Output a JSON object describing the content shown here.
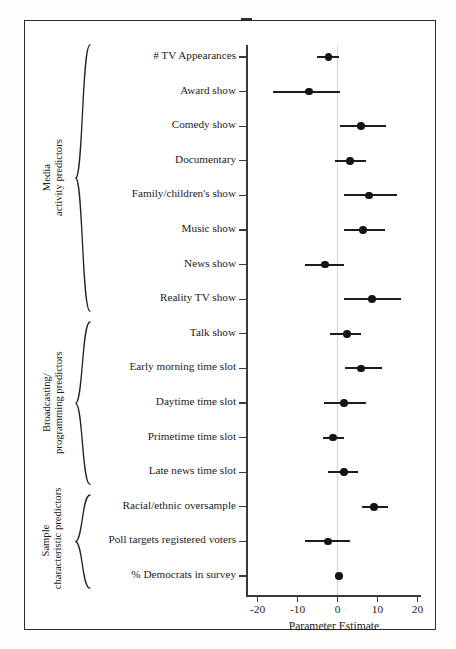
{
  "chart_data": {
    "type": "scatter",
    "title": "",
    "xlabel": "Parameter Estimate",
    "ylabel": "",
    "xlim": [
      -24,
      20
    ],
    "xticks": [
      -20,
      -10,
      0,
      10,
      20
    ],
    "xticklabels": [
      "-20",
      "-10",
      "0",
      "10",
      "20"
    ],
    "grid": false,
    "legend": "none",
    "zero_reference_line": 0,
    "categories": [
      "# TV Appearances",
      "Award show",
      "Comedy show",
      "Documentary",
      "Family/children's show",
      "Music show",
      "News show",
      "Reality TV show",
      "Talk show",
      "Early morning time slot",
      "Daytime time slot",
      "Primetime time slot",
      "Late news time slot",
      "Racial/ethnic oversample",
      "Poll targets registered voters",
      "% Democrats in survey"
    ],
    "values": [
      -2.3,
      -7.1,
      5.9,
      3.1,
      7.9,
      6.4,
      -3.1,
      8.6,
      2.4,
      5.9,
      1.6,
      -1.1,
      1.6,
      9.1,
      -2.4,
      0.4
    ],
    "ci_low": [
      -5.1,
      -16.1,
      0.6,
      -0.6,
      1.6,
      1.6,
      -8.1,
      1.6,
      -1.9,
      1.9,
      -3.4,
      -3.6,
      -2.4,
      6.1,
      -8.1,
      null
    ],
    "ci_high": [
      0.4,
      0.6,
      12.1,
      7.1,
      14.9,
      11.9,
      1.6,
      15.9,
      5.9,
      11.1,
      7.1,
      1.6,
      5.1,
      12.6,
      3.1,
      null
    ],
    "groups": [
      {
        "label_line1": "Media",
        "label_line2": "activity predictors",
        "first_index": 0,
        "last_index": 7
      },
      {
        "label_line1": "Broadcasting/",
        "label_line2": "programming predictors",
        "first_index": 8,
        "last_index": 12
      },
      {
        "label_line1": "Sample",
        "label_line2": "characteristic predictors",
        "first_index": 13,
        "last_index": 15
      }
    ],
    "marker_color": "#141414",
    "line_color": "#1d1d1d",
    "axis_color": "#3a3a3a",
    "zero_line_color": "#d8d8d8"
  }
}
